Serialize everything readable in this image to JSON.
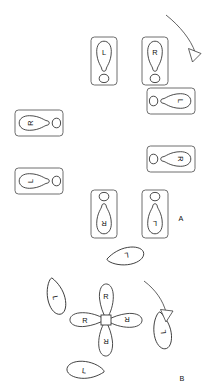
{
  "figure": {
    "background_color": "#ffffff",
    "ink_color": "#2b2b2b",
    "panels": [
      {
        "id": "A",
        "label": "A",
        "label_position": {
          "x": 181,
          "y": 220
        },
        "kind": "ring-of-cards",
        "description": "Eight footprint cards arranged in a ring, each card rotated progressively",
        "rotation_arrow": {
          "name": "rotation-arrow-a",
          "direction": "clockwise",
          "from": {
            "x": 166,
            "y": 16
          },
          "to": {
            "x": 196,
            "y": 58
          }
        },
        "cards": [
          {
            "index": 0,
            "label": "L",
            "foot": "left",
            "card_rotation_deg": 0,
            "x": 91,
            "y": 37,
            "w": 26,
            "h": 48
          },
          {
            "index": 1,
            "label": "R",
            "foot": "right",
            "card_rotation_deg": 0,
            "x": 142,
            "y": 37,
            "w": 26,
            "h": 48
          },
          {
            "index": 2,
            "label": "L",
            "foot": "left",
            "card_rotation_deg": 90,
            "x": 169,
            "y": 88,
            "w": 26,
            "h": 48
          },
          {
            "index": 3,
            "label": "R",
            "foot": "right",
            "card_rotation_deg": 90,
            "x": 169,
            "y": 146,
            "w": 26,
            "h": 48
          },
          {
            "index": 4,
            "label": "L",
            "foot": "left",
            "card_rotation_deg": 180,
            "x": 142,
            "y": 190,
            "w": 26,
            "h": 48
          },
          {
            "index": 5,
            "label": "R",
            "foot": "right",
            "card_rotation_deg": 180,
            "x": 91,
            "y": 190,
            "w": 26,
            "h": 48
          },
          {
            "index": 6,
            "label": "L",
            "foot": "left",
            "card_rotation_deg": 270,
            "x": 41,
            "y": 146,
            "w": 26,
            "h": 48
          },
          {
            "index": 7,
            "label": "R",
            "foot": "right",
            "card_rotation_deg": 270,
            "x": 41,
            "y": 88,
            "w": 26,
            "h": 48
          }
        ]
      },
      {
        "id": "B",
        "label": "B",
        "label_position": {
          "x": 181,
          "y": 380
        },
        "kind": "pinwheel",
        "description": "Four inner footprints radiating from a central hub, with four outer free footprints",
        "center": {
          "x": 106,
          "y": 320
        },
        "hub_size": 10,
        "rotation_arrow": {
          "name": "rotation-arrow-b",
          "direction": "clockwise",
          "from": {
            "x": 163,
            "y": 249
          },
          "to": {
            "x": 176,
            "y": 318
          }
        },
        "inner_feet": [
          {
            "index": 0,
            "label": "R",
            "foot": "right",
            "angle_deg": 0,
            "length": 36
          },
          {
            "index": 1,
            "label": "R",
            "foot": "right",
            "angle_deg": 90,
            "length": 36
          },
          {
            "index": 2,
            "label": "R",
            "foot": "right",
            "angle_deg": 180,
            "length": 36
          },
          {
            "index": 3,
            "label": "R",
            "foot": "right",
            "angle_deg": 270,
            "length": 36
          }
        ],
        "outer_feet": [
          {
            "index": 0,
            "label": "L",
            "foot": "left",
            "angle_deg": 28,
            "x": 129,
            "y": 253,
            "rot": 105
          },
          {
            "index": 1,
            "label": "L",
            "foot": "left",
            "angle_deg": 118,
            "x": 160,
            "y": 345,
            "rot": 188
          },
          {
            "index": 2,
            "label": "L",
            "foot": "left",
            "angle_deg": 208,
            "x": 82,
            "y": 366,
            "rot": 284
          },
          {
            "index": 3,
            "label": "L",
            "foot": "left",
            "angle_deg": 298,
            "x": 51,
            "y": 291,
            "rot": 7
          }
        ]
      }
    ],
    "letters_used": [
      "L",
      "R"
    ],
    "panel_labels": [
      "A",
      "B"
    ]
  }
}
